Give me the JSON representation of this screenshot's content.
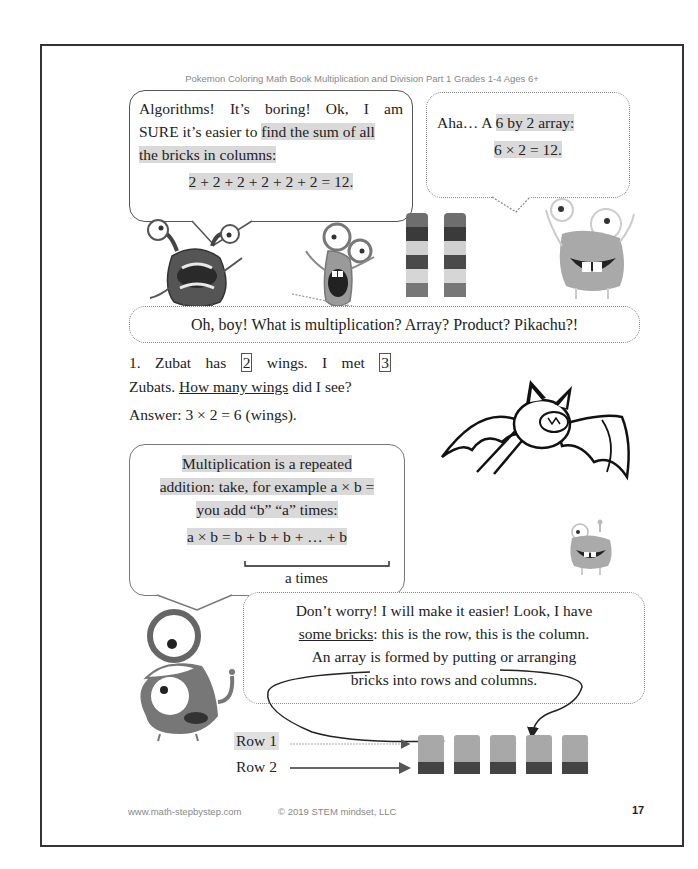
{
  "header": {
    "title": "Pokemon Coloring Math Book Multiplication and Division Part 1 Grades 1-4 Ages 6+"
  },
  "bubble_algorithms": {
    "line1": "Algorithms! It’s boring! Ok, I am",
    "line2_plain": "SURE it’s easier to ",
    "line2_hl": "find the sum of all",
    "line3_hl": "the bricks in columns:",
    "equation": "2 + 2 + 2 + 2 + 2 + 2 = 12."
  },
  "bubble_aha": {
    "line1_plain": "Aha… A ",
    "line1_hl": "6 by 2 array:",
    "equation": "6 × 2 = 12."
  },
  "bubble_question": {
    "text": "Oh, boy! What is multiplication? Array? Product? Pikachu?!"
  },
  "problem": {
    "number": "1.",
    "part1": "Zubat has",
    "wings_count": "2",
    "part2": "wings. I met",
    "zubat_count": "3",
    "part3": "Zubats.",
    "underlined": "How many wings",
    "part4": "did I see?",
    "answer": "Answer: 3 × 2 = 6 (wings)."
  },
  "bubble_definition": {
    "line1": "Multiplication is a repeated",
    "line2": "addition: take, for example a × b =",
    "line3": "you add “b” “a” times:",
    "eq_left": "a × b = ",
    "eq_right": "b + b + b + … + b",
    "brace_label": "a times"
  },
  "bubble_bricks": {
    "line1": "Don’t worry! I will make it easier! Look, I have",
    "line2_a": "some bricks",
    "line2_b": ": this is the row, this is the column.",
    "line3": "An array is formed by putting or arranging",
    "line4": "bricks into rows and columns."
  },
  "array_diagram": {
    "row1_label": "Row 1",
    "row2_label": "Row 2",
    "columns": 5,
    "row1_color": "#a8a8a8",
    "row2_color": "#444444"
  },
  "brick_towers": {
    "count": 2,
    "colors": [
      "#6e6e6e",
      "#3a3a3a",
      "#d0d0d0",
      "#4a4a4a",
      "#d6d6d6",
      "#777777"
    ]
  },
  "footer": {
    "website": "www.math-stepbystep.com",
    "copyright": "© 2019 STEM mindset, LLC",
    "page_number": "17"
  },
  "illustrations": {
    "monster_1": "dark-monster-icon",
    "monster_2": "tall-monster-icon",
    "monster_3": "smiling-monster-icon",
    "zubat": "zubat-bat-icon",
    "monster_small": "small-monster-icon",
    "monster_stacked": "stacked-eyes-monster-icon"
  }
}
